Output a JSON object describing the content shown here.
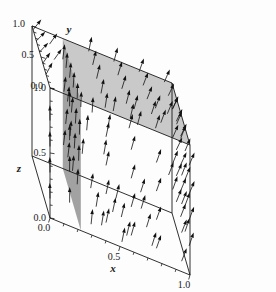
{
  "chart_data": {
    "type": "scatter",
    "title": "",
    "subtitle": "",
    "plot_kind": "3d-vector-field-with-slice-planes",
    "xlabel": "x",
    "ylabel": "y",
    "zlabel": "z",
    "xlim": [
      0.0,
      1.0
    ],
    "ylim": [
      0.0,
      1.0
    ],
    "zlim": [
      0.0,
      1.0
    ],
    "grid": false,
    "legend": "none",
    "axes": [
      {
        "name": "x",
        "label": "x",
        "ticks": [
          0.0,
          0.5,
          1.0
        ],
        "tick_labels": [
          "0.0",
          "0.5",
          "1.0"
        ],
        "minor_ticks": 8,
        "position": "bottom-front-edge"
      },
      {
        "name": "y",
        "label": "y",
        "ticks": [
          0.0,
          0.5,
          1.0
        ],
        "tick_labels": [
          "0.0",
          "0.5",
          "1.0"
        ],
        "minor_ticks": 8,
        "position": "top-left-back-edge"
      },
      {
        "name": "z",
        "label": "z",
        "ticks": [
          0.0,
          0.5,
          1.0
        ],
        "tick_labels": [
          "0.0",
          "0.5",
          "1.0"
        ],
        "minor_ticks": 8,
        "position": "left-vertical-edge"
      }
    ],
    "planes": [
      {
        "name": "horizontal-slice-plane",
        "orientation": "horizontal",
        "constant_axis": "z",
        "constant_value": 1.0,
        "color": "#c6c6c6",
        "opacity": 0.95,
        "corners_xyz": [
          [
            0.22,
            0.0,
            1.0
          ],
          [
            1.0,
            0.0,
            1.0
          ],
          [
            1.0,
            1.0,
            1.0
          ],
          [
            0.22,
            1.0,
            1.0
          ]
        ]
      },
      {
        "name": "vertical-slice-plane",
        "orientation": "vertical",
        "constant_axis": "x",
        "constant_value": 0.22,
        "color": "#9d9d9d",
        "opacity": 0.95,
        "corners_xyz": [
          [
            0.22,
            0.0,
            0.0
          ],
          [
            0.22,
            1.0,
            0.0
          ],
          [
            0.22,
            1.0,
            1.0
          ],
          [
            0.22,
            0.0,
            1.0
          ]
        ]
      }
    ],
    "arrow_color": "#111111",
    "arrow_count": 118,
    "arrows": [
      {
        "x": 0.0,
        "y": 0.0,
        "z": 0.75,
        "u": 0.0,
        "v": 0.05,
        "w": 0.95
      },
      {
        "x": 0.0,
        "y": 0.0,
        "z": 0.55,
        "u": 0.0,
        "v": 0.05,
        "w": 0.95
      },
      {
        "x": 0.0,
        "y": 0.0,
        "z": 0.35,
        "u": 0.0,
        "v": 0.08,
        "w": 0.92
      },
      {
        "x": 0.0,
        "y": 0.0,
        "z": 0.15,
        "u": 0.0,
        "v": 0.1,
        "w": 0.9
      },
      {
        "x": 0.0,
        "y": 0.22,
        "z": 1.0,
        "u": 0.35,
        "v": 0.35,
        "w": 0.6
      },
      {
        "x": 0.0,
        "y": 0.4,
        "z": 1.0,
        "u": 0.4,
        "v": 0.35,
        "w": 0.55
      },
      {
        "x": 0.0,
        "y": 0.58,
        "z": 1.0,
        "u": 0.45,
        "v": 0.35,
        "w": 0.5
      },
      {
        "x": 0.0,
        "y": 0.76,
        "z": 1.0,
        "u": 0.45,
        "v": 0.3,
        "w": 0.5
      },
      {
        "x": 0.0,
        "y": 0.94,
        "z": 1.0,
        "u": 0.4,
        "v": 0.25,
        "w": 0.55
      },
      {
        "x": 0.22,
        "y": 0.0,
        "z": 0.95,
        "u": 0.05,
        "v": 0.15,
        "w": 0.85
      },
      {
        "x": 0.22,
        "y": 0.2,
        "z": 0.92,
        "u": 0.05,
        "v": 0.2,
        "w": 0.8
      },
      {
        "x": 0.22,
        "y": 0.42,
        "z": 0.9,
        "u": 0.08,
        "v": 0.22,
        "w": 0.78
      },
      {
        "x": 0.22,
        "y": 0.62,
        "z": 0.88,
        "u": 0.1,
        "v": 0.25,
        "w": 0.75
      },
      {
        "x": 0.22,
        "y": 0.82,
        "z": 0.86,
        "u": 0.1,
        "v": 0.25,
        "w": 0.75
      },
      {
        "x": 0.22,
        "y": 1.0,
        "z": 0.84,
        "u": 0.12,
        "v": 0.22,
        "w": 0.75
      },
      {
        "x": 0.22,
        "y": 0.08,
        "z": 0.7,
        "u": 0.05,
        "v": 0.2,
        "w": 0.8
      },
      {
        "x": 0.22,
        "y": 0.3,
        "z": 0.68,
        "u": 0.08,
        "v": 0.25,
        "w": 0.75
      },
      {
        "x": 0.22,
        "y": 0.52,
        "z": 0.66,
        "u": 0.1,
        "v": 0.28,
        "w": 0.72
      },
      {
        "x": 0.22,
        "y": 0.74,
        "z": 0.64,
        "u": 0.12,
        "v": 0.28,
        "w": 0.7
      },
      {
        "x": 0.22,
        "y": 0.94,
        "z": 0.62,
        "u": 0.12,
        "v": 0.25,
        "w": 0.72
      },
      {
        "x": 0.22,
        "y": 0.12,
        "z": 0.48,
        "u": 0.05,
        "v": 0.25,
        "w": 0.75
      },
      {
        "x": 0.22,
        "y": 0.36,
        "z": 0.46,
        "u": 0.08,
        "v": 0.28,
        "w": 0.72
      },
      {
        "x": 0.22,
        "y": 0.6,
        "z": 0.44,
        "u": 0.1,
        "v": 0.3,
        "w": 0.7
      },
      {
        "x": 0.22,
        "y": 0.84,
        "z": 0.42,
        "u": 0.12,
        "v": 0.3,
        "w": 0.68
      },
      {
        "x": 0.22,
        "y": 0.2,
        "z": 0.26,
        "u": 0.08,
        "v": 0.3,
        "w": 0.7
      },
      {
        "x": 0.22,
        "y": 0.46,
        "z": 0.24,
        "u": 0.1,
        "v": 0.32,
        "w": 0.68
      },
      {
        "x": 0.22,
        "y": 0.72,
        "z": 0.22,
        "u": 0.12,
        "v": 0.32,
        "w": 0.66
      },
      {
        "x": 0.22,
        "y": 0.96,
        "z": 0.2,
        "u": 0.12,
        "v": 0.3,
        "w": 0.68
      },
      {
        "x": 0.4,
        "y": 0.05,
        "z": 1.0,
        "u": 0.15,
        "v": 0.3,
        "w": 0.7
      },
      {
        "x": 0.4,
        "y": 0.28,
        "z": 1.0,
        "u": 0.18,
        "v": 0.32,
        "w": 0.68
      },
      {
        "x": 0.4,
        "y": 0.52,
        "z": 1.0,
        "u": 0.2,
        "v": 0.32,
        "w": 0.66
      },
      {
        "x": 0.4,
        "y": 0.74,
        "z": 1.0,
        "u": 0.2,
        "v": 0.3,
        "w": 0.68
      },
      {
        "x": 0.4,
        "y": 0.96,
        "z": 1.0,
        "u": 0.18,
        "v": 0.28,
        "w": 0.7
      },
      {
        "x": 0.58,
        "y": 0.05,
        "z": 1.0,
        "u": 0.2,
        "v": 0.32,
        "w": 0.68
      },
      {
        "x": 0.58,
        "y": 0.28,
        "z": 1.0,
        "u": 0.22,
        "v": 0.34,
        "w": 0.66
      },
      {
        "x": 0.58,
        "y": 0.52,
        "z": 1.0,
        "u": 0.24,
        "v": 0.34,
        "w": 0.64
      },
      {
        "x": 0.58,
        "y": 0.74,
        "z": 1.0,
        "u": 0.24,
        "v": 0.32,
        "w": 0.66
      },
      {
        "x": 0.58,
        "y": 0.96,
        "z": 1.0,
        "u": 0.22,
        "v": 0.3,
        "w": 0.68
      },
      {
        "x": 0.76,
        "y": 0.05,
        "z": 1.0,
        "u": 0.25,
        "v": 0.34,
        "w": 0.64
      },
      {
        "x": 0.76,
        "y": 0.28,
        "z": 1.0,
        "u": 0.26,
        "v": 0.35,
        "w": 0.62
      },
      {
        "x": 0.76,
        "y": 0.52,
        "z": 1.0,
        "u": 0.28,
        "v": 0.35,
        "w": 0.6
      },
      {
        "x": 0.76,
        "y": 0.74,
        "z": 1.0,
        "u": 0.28,
        "v": 0.33,
        "w": 0.62
      },
      {
        "x": 0.76,
        "y": 0.96,
        "z": 1.0,
        "u": 0.26,
        "v": 0.3,
        "w": 0.64
      },
      {
        "x": 0.94,
        "y": 0.05,
        "z": 1.0,
        "u": 0.28,
        "v": 0.35,
        "w": 0.62
      },
      {
        "x": 0.94,
        "y": 0.28,
        "z": 1.0,
        "u": 0.3,
        "v": 0.36,
        "w": 0.6
      },
      {
        "x": 0.94,
        "y": 0.52,
        "z": 1.0,
        "u": 0.32,
        "v": 0.36,
        "w": 0.58
      },
      {
        "x": 0.94,
        "y": 0.74,
        "z": 1.0,
        "u": 0.32,
        "v": 0.34,
        "w": 0.6
      },
      {
        "x": 0.94,
        "y": 0.96,
        "z": 1.0,
        "u": 0.3,
        "v": 0.32,
        "w": 0.62
      },
      {
        "x": 1.0,
        "y": 0.05,
        "z": 0.82,
        "u": 0.3,
        "v": 0.3,
        "w": 0.65
      },
      {
        "x": 1.0,
        "y": 0.05,
        "z": 0.6,
        "u": 0.3,
        "v": 0.28,
        "w": 0.68
      },
      {
        "x": 1.0,
        "y": 0.05,
        "z": 0.4,
        "u": 0.28,
        "v": 0.26,
        "w": 0.7
      },
      {
        "x": 1.0,
        "y": 0.05,
        "z": 0.2,
        "u": 0.26,
        "v": 0.24,
        "w": 0.72
      },
      {
        "x": 1.0,
        "y": 0.28,
        "z": 0.82,
        "u": 0.3,
        "v": 0.3,
        "w": 0.65
      },
      {
        "x": 1.0,
        "y": 0.28,
        "z": 0.6,
        "u": 0.3,
        "v": 0.28,
        "w": 0.68
      },
      {
        "x": 1.0,
        "y": 0.28,
        "z": 0.4,
        "u": 0.28,
        "v": 0.26,
        "w": 0.7
      },
      {
        "x": 1.0,
        "y": 0.28,
        "z": 0.2,
        "u": 0.26,
        "v": 0.24,
        "w": 0.72
      },
      {
        "x": 1.0,
        "y": 0.52,
        "z": 0.82,
        "u": 0.32,
        "v": 0.3,
        "w": 0.64
      },
      {
        "x": 1.0,
        "y": 0.52,
        "z": 0.6,
        "u": 0.32,
        "v": 0.28,
        "w": 0.66
      },
      {
        "x": 1.0,
        "y": 0.52,
        "z": 0.4,
        "u": 0.3,
        "v": 0.26,
        "w": 0.68
      },
      {
        "x": 1.0,
        "y": 0.52,
        "z": 0.2,
        "u": 0.28,
        "v": 0.24,
        "w": 0.7
      },
      {
        "x": 1.0,
        "y": 0.76,
        "z": 0.82,
        "u": 0.32,
        "v": 0.28,
        "w": 0.64
      },
      {
        "x": 1.0,
        "y": 0.76,
        "z": 0.6,
        "u": 0.32,
        "v": 0.26,
        "w": 0.66
      },
      {
        "x": 1.0,
        "y": 0.76,
        "z": 0.4,
        "u": 0.3,
        "v": 0.24,
        "w": 0.68
      },
      {
        "x": 1.0,
        "y": 0.76,
        "z": 0.2,
        "u": 0.28,
        "v": 0.22,
        "w": 0.7
      },
      {
        "x": 1.0,
        "y": 0.96,
        "z": 0.82,
        "u": 0.3,
        "v": 0.26,
        "w": 0.66
      },
      {
        "x": 1.0,
        "y": 0.96,
        "z": 0.6,
        "u": 0.3,
        "v": 0.24,
        "w": 0.68
      },
      {
        "x": 1.0,
        "y": 0.96,
        "z": 0.4,
        "u": 0.28,
        "v": 0.22,
        "w": 0.7
      },
      {
        "x": 1.0,
        "y": 0.96,
        "z": 0.2,
        "u": 0.26,
        "v": 0.2,
        "w": 0.72
      },
      {
        "x": 0.4,
        "y": 0.0,
        "z": 0.8,
        "u": 0.18,
        "v": 0.25,
        "w": 0.72
      },
      {
        "x": 0.58,
        "y": 0.0,
        "z": 0.78,
        "u": 0.22,
        "v": 0.26,
        "w": 0.7
      },
      {
        "x": 0.76,
        "y": 0.0,
        "z": 0.76,
        "u": 0.26,
        "v": 0.27,
        "w": 0.68
      },
      {
        "x": 0.94,
        "y": 0.0,
        "z": 0.74,
        "u": 0.28,
        "v": 0.28,
        "w": 0.66
      },
      {
        "x": 0.4,
        "y": 0.0,
        "z": 0.58,
        "u": 0.18,
        "v": 0.24,
        "w": 0.72
      },
      {
        "x": 0.58,
        "y": 0.0,
        "z": 0.56,
        "u": 0.22,
        "v": 0.25,
        "w": 0.7
      },
      {
        "x": 0.76,
        "y": 0.0,
        "z": 0.54,
        "u": 0.26,
        "v": 0.26,
        "w": 0.68
      },
      {
        "x": 0.94,
        "y": 0.0,
        "z": 0.52,
        "u": 0.28,
        "v": 0.27,
        "w": 0.66
      },
      {
        "x": 0.4,
        "y": 0.0,
        "z": 0.36,
        "u": 0.18,
        "v": 0.22,
        "w": 0.74
      },
      {
        "x": 0.58,
        "y": 0.0,
        "z": 0.34,
        "u": 0.22,
        "v": 0.23,
        "w": 0.72
      },
      {
        "x": 0.76,
        "y": 0.0,
        "z": 0.32,
        "u": 0.26,
        "v": 0.24,
        "w": 0.7
      },
      {
        "x": 0.94,
        "y": 0.0,
        "z": 0.3,
        "u": 0.28,
        "v": 0.25,
        "w": 0.68
      },
      {
        "x": 0.4,
        "y": 0.0,
        "z": 0.14,
        "u": 0.18,
        "v": 0.2,
        "w": 0.76
      },
      {
        "x": 0.58,
        "y": 0.0,
        "z": 0.12,
        "u": 0.22,
        "v": 0.21,
        "w": 0.74
      },
      {
        "x": 0.76,
        "y": 0.0,
        "z": 0.1,
        "u": 0.26,
        "v": 0.22,
        "w": 0.72
      },
      {
        "x": 0.94,
        "y": 0.0,
        "z": 0.08,
        "u": 0.28,
        "v": 0.23,
        "w": 0.7
      },
      {
        "x": 0.4,
        "y": 0.25,
        "z": 0.0,
        "u": 0.15,
        "v": 0.25,
        "w": 0.72
      },
      {
        "x": 0.58,
        "y": 0.25,
        "z": 0.0,
        "u": 0.2,
        "v": 0.26,
        "w": 0.7
      },
      {
        "x": 0.76,
        "y": 0.25,
        "z": 0.0,
        "u": 0.24,
        "v": 0.27,
        "w": 0.68
      },
      {
        "x": 0.4,
        "y": 0.55,
        "z": 0.0,
        "u": 0.15,
        "v": 0.28,
        "w": 0.7
      },
      {
        "x": 0.58,
        "y": 0.55,
        "z": 0.0,
        "u": 0.2,
        "v": 0.29,
        "w": 0.68
      },
      {
        "x": 0.76,
        "y": 0.55,
        "z": 0.0,
        "u": 0.24,
        "v": 0.3,
        "w": 0.66
      },
      {
        "x": 0.4,
        "y": 0.85,
        "z": 0.0,
        "u": 0.15,
        "v": 0.3,
        "w": 0.68
      },
      {
        "x": 0.58,
        "y": 0.85,
        "z": 0.0,
        "u": 0.2,
        "v": 0.31,
        "w": 0.66
      },
      {
        "x": 0.76,
        "y": 0.85,
        "z": 0.0,
        "u": 0.24,
        "v": 0.32,
        "w": 0.64
      },
      {
        "x": 0.32,
        "y": 0.15,
        "z": 0.88,
        "u": 0.08,
        "v": 0.22,
        "w": 0.78
      },
      {
        "x": 0.5,
        "y": 0.38,
        "z": 0.86,
        "u": 0.16,
        "v": 0.26,
        "w": 0.72
      },
      {
        "x": 0.68,
        "y": 0.62,
        "z": 0.84,
        "u": 0.22,
        "v": 0.28,
        "w": 0.7
      },
      {
        "x": 0.86,
        "y": 0.84,
        "z": 0.82,
        "u": 0.28,
        "v": 0.3,
        "w": 0.66
      },
      {
        "x": 0.32,
        "y": 0.45,
        "z": 0.6,
        "u": 0.1,
        "v": 0.28,
        "w": 0.72
      },
      {
        "x": 0.5,
        "y": 0.68,
        "z": 0.58,
        "u": 0.16,
        "v": 0.3,
        "w": 0.7
      },
      {
        "x": 0.68,
        "y": 0.9,
        "z": 0.56,
        "u": 0.22,
        "v": 0.3,
        "w": 0.68
      },
      {
        "x": 0.32,
        "y": 0.7,
        "z": 0.3,
        "u": 0.1,
        "v": 0.3,
        "w": 0.7
      },
      {
        "x": 0.5,
        "y": 0.9,
        "z": 0.28,
        "u": 0.16,
        "v": 0.31,
        "w": 0.68
      },
      {
        "x": 0.14,
        "y": 0.0,
        "z": 0.92,
        "u": 0.02,
        "v": 0.12,
        "w": 0.88
      },
      {
        "x": 0.14,
        "y": 0.0,
        "z": 0.66,
        "u": 0.02,
        "v": 0.12,
        "w": 0.88
      },
      {
        "x": 0.14,
        "y": 0.0,
        "z": 0.42,
        "u": 0.02,
        "v": 0.12,
        "w": 0.88
      },
      {
        "x": 0.14,
        "y": 0.0,
        "z": 0.18,
        "u": 0.02,
        "v": 0.12,
        "w": 0.88
      },
      {
        "x": 0.1,
        "y": 0.55,
        "z": 1.0,
        "u": 0.4,
        "v": 0.34,
        "w": 0.55
      },
      {
        "x": 0.1,
        "y": 0.8,
        "z": 1.0,
        "u": 0.4,
        "v": 0.3,
        "w": 0.58
      },
      {
        "x": 0.64,
        "y": 0.12,
        "z": 0.94,
        "u": 0.22,
        "v": 0.28,
        "w": 0.7
      },
      {
        "x": 0.84,
        "y": 0.38,
        "z": 0.92,
        "u": 0.28,
        "v": 0.3,
        "w": 0.66
      },
      {
        "x": 0.92,
        "y": 0.64,
        "z": 0.9,
        "u": 0.3,
        "v": 0.31,
        "w": 0.64
      },
      {
        "x": 0.46,
        "y": 0.1,
        "z": 0.2,
        "u": 0.18,
        "v": 0.22,
        "w": 0.74
      },
      {
        "x": 0.66,
        "y": 0.1,
        "z": 0.44,
        "u": 0.24,
        "v": 0.24,
        "w": 0.7
      },
      {
        "x": 0.86,
        "y": 0.1,
        "z": 0.66,
        "u": 0.28,
        "v": 0.26,
        "w": 0.68
      },
      {
        "x": 0.3,
        "y": 0.05,
        "z": 0.06,
        "u": 0.1,
        "v": 0.18,
        "w": 0.8
      },
      {
        "x": 0.52,
        "y": 0.05,
        "z": 0.02,
        "u": 0.18,
        "v": 0.2,
        "w": 0.78
      }
    ]
  }
}
